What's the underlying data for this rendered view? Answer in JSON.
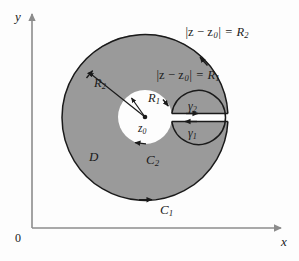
{
  "figure": {
    "title_hidden": "Annular region D between two concentric circles with a slit",
    "colors": {
      "region_fill": "#9a9a9a",
      "curve_stroke": "#1a1a1a",
      "axis_stroke": "#8c8c8c",
      "background": "#fdfdfd",
      "inner_fill": "#ffffff"
    }
  },
  "axes": {
    "y_label": "y",
    "x_label": "x",
    "origin_label": "0"
  },
  "geometry": {
    "center": {
      "x": 145,
      "y": 117
    },
    "outer_radius": 83,
    "inner_radius": 27,
    "slit_top_y": 113.5,
    "slit_bottom_y": 121.5
  },
  "labels": {
    "outer_equation": "|z − z",
    "outer_equation_sub": "0",
    "outer_equation_tail": "| = R",
    "outer_equation_radius_sub": "2",
    "inner_equation": "|z − z",
    "inner_equation_sub": "0",
    "inner_equation_tail": "| = R",
    "inner_equation_radius_sub": "1",
    "outer_radius_label": "R",
    "outer_radius_sub": "2",
    "inner_radius_label": "R",
    "inner_radius_sub": "1",
    "center_point": "z",
    "center_point_sub": "0",
    "region": "D",
    "outer_curve": "C",
    "outer_curve_sub": "1",
    "inner_curve": "C",
    "inner_curve_sub": "2",
    "slit_upper": "γ",
    "slit_upper_sub": "2",
    "slit_lower": "γ",
    "slit_lower_sub": "1"
  }
}
